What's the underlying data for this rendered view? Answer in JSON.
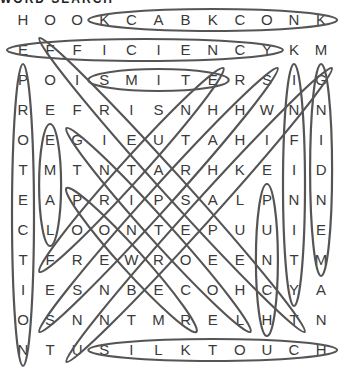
{
  "header": {
    "partial_title": "WORD SEARCH"
  },
  "puzzle": {
    "rows": [
      [
        "H",
        "O",
        "O",
        "K",
        "C",
        "A",
        "B",
        "K",
        "C",
        "O",
        "N",
        "K"
      ],
      [
        "E",
        "F",
        "F",
        "I",
        "C",
        "I",
        "E",
        "N",
        "C",
        "Y",
        "K",
        "M"
      ],
      [
        "P",
        "O",
        "I",
        "S",
        "M",
        "I",
        "T",
        "E",
        "R",
        "S",
        "I",
        "G"
      ],
      [
        "R",
        "E",
        "F",
        "R",
        "I",
        "S",
        "N",
        "H",
        "H",
        "W",
        "N",
        "N"
      ],
      [
        "O",
        "E",
        "G",
        "I",
        "E",
        "U",
        "T",
        "A",
        "H",
        "I",
        "F",
        "I"
      ],
      [
        "T",
        "M",
        "T",
        "N",
        "T",
        "A",
        "R",
        "H",
        "K",
        "E",
        "I",
        "D"
      ],
      [
        "E",
        "A",
        "P",
        "R",
        "I",
        "P",
        "S",
        "A",
        "L",
        "P",
        "N",
        "N"
      ],
      [
        "C",
        "L",
        "O",
        "O",
        "N",
        "T",
        "E",
        "P",
        "U",
        "U",
        "I",
        "E"
      ],
      [
        "T",
        "F",
        "R",
        "E",
        "W",
        "R",
        "O",
        "E",
        "E",
        "N",
        "T",
        "M"
      ],
      [
        "I",
        "E",
        "S",
        "N",
        "B",
        "E",
        "C",
        "O",
        "H",
        "C",
        "Y",
        "A"
      ],
      [
        "O",
        "S",
        "N",
        "N",
        "T",
        "M",
        "R",
        "E",
        "L",
        "H",
        "T",
        "N"
      ],
      [
        "N",
        "T",
        "U",
        "S",
        "I",
        "L",
        "K",
        "T",
        "O",
        "U",
        "C",
        "H"
      ]
    ],
    "found_words": [
      {
        "word": "KNOCKBACK",
        "from": [
          0,
          3
        ],
        "to": [
          0,
          11
        ]
      },
      {
        "word": "EFFICIENCY",
        "from": [
          1,
          0
        ],
        "to": [
          1,
          9
        ]
      },
      {
        "word": "SMITE",
        "from": [
          2,
          3
        ],
        "to": [
          2,
          7
        ]
      },
      {
        "word": "SILKTOUCH",
        "from": [
          11,
          3
        ],
        "to": [
          11,
          11
        ]
      },
      {
        "word": "PROTECTION",
        "from": [
          2,
          0
        ],
        "to": [
          11,
          0
        ]
      },
      {
        "word": "LAME",
        "from": [
          4,
          1
        ],
        "to": [
          7,
          1
        ]
      },
      {
        "word": "PUNCH",
        "from": [
          6,
          9
        ],
        "to": [
          10,
          9
        ]
      },
      {
        "word": "INFINITY",
        "from": [
          2,
          10
        ],
        "to": [
          9,
          10
        ]
      },
      {
        "word": "MENDING",
        "from": [
          2,
          11
        ],
        "to": [
          8,
          11
        ]
      },
      {
        "word": "FIREASPECT",
        "from": [
          1,
          1
        ],
        "to": [
          10,
          10
        ]
      },
      {
        "word": "LOOTING",
        "from": [
          4,
          2
        ],
        "to": [
          10,
          8
        ]
      },
      {
        "word": "POWER",
        "from": [
          6,
          2
        ],
        "to": [
          10,
          6
        ]
      },
      {
        "word": "FORTUNE",
        "from": [
          2,
          7
        ],
        "to": [
          8,
          1
        ]
      },
      {
        "word": "SHARPNESS",
        "from": [
          2,
          9
        ],
        "to": [
          10,
          1
        ]
      },
      {
        "word": "UNBREAKING",
        "from": [
          2,
          11
        ],
        "to": [
          11,
          2
        ]
      }
    ]
  },
  "colors": {
    "text": "#3a3a3a",
    "stroke": "#555555",
    "background": "#ffffff"
  }
}
